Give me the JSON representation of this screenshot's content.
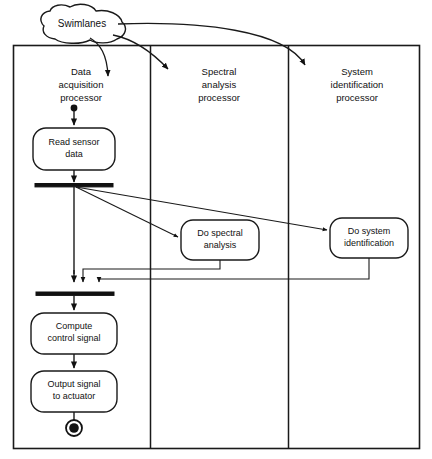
{
  "diagram": {
    "kind": "uml-activity-diagram-with-swimlanes",
    "annotation": {
      "label": "Swimlanes"
    },
    "lanes": [
      {
        "id": "data-acquisition",
        "title_line1": "Data",
        "title_line2": "acquisition",
        "title_line3": "processor"
      },
      {
        "id": "spectral-analysis",
        "title_line1": "Spectral",
        "title_line2": "analysis",
        "title_line3": "processor"
      },
      {
        "id": "system-identification",
        "title_line1": "System",
        "title_line2": "identification",
        "title_line3": "processor"
      }
    ],
    "activities": [
      {
        "id": "read-sensor-data",
        "lane": "data-acquisition",
        "line1": "Read sensor",
        "line2": "data"
      },
      {
        "id": "do-spectral-analysis",
        "lane": "spectral-analysis",
        "line1": "Do spectral",
        "line2": "analysis"
      },
      {
        "id": "do-system-identification",
        "lane": "system-identification",
        "line1": "Do system",
        "line2": "identification"
      },
      {
        "id": "compute-control-signal",
        "lane": "data-acquisition",
        "line1": "Compute",
        "line2": "control signal"
      },
      {
        "id": "output-signal-to-actuator",
        "lane": "data-acquisition",
        "line1": "Output signal",
        "line2": "to actuator"
      }
    ],
    "control_nodes": [
      {
        "id": "initial-node",
        "type": "initial"
      },
      {
        "id": "fork-bar",
        "type": "fork"
      },
      {
        "id": "join-bar",
        "type": "join"
      },
      {
        "id": "final-node",
        "type": "final"
      }
    ],
    "colors": {
      "stroke": "#1a1a1a",
      "fill": "#ffffff",
      "node": "#111111"
    }
  }
}
